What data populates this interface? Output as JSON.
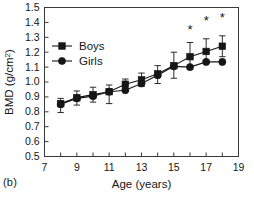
{
  "panel": {
    "label": "(b)"
  },
  "chart_data": {
    "type": "line",
    "title": "",
    "xlabel": "Age (years)",
    "ylabel": "BMD (g/cm²)",
    "xlim": [
      7,
      19
    ],
    "ylim": [
      0.5,
      1.5
    ],
    "xticks": [
      7,
      8,
      9,
      10,
      11,
      12,
      13,
      14,
      15,
      16,
      17,
      18,
      19
    ],
    "xticklabels": [
      "7",
      "",
      "9",
      "",
      "11",
      "",
      "13",
      "",
      "15",
      "",
      "17",
      "",
      "19"
    ],
    "yticks": [
      0.5,
      0.6,
      0.7,
      0.8,
      0.9,
      1.0,
      1.1,
      1.2,
      1.3,
      1.4,
      1.5
    ],
    "yticklabels": [
      "0.5",
      "0.6",
      "0.7",
      "0.8",
      "0.9",
      "1.0",
      "1.1",
      "1.2",
      "1.3",
      "1.4",
      "1.5"
    ],
    "grid": false,
    "legend_position": "upper left",
    "x": [
      8,
      9,
      10,
      11,
      12,
      13,
      14,
      15,
      16,
      17,
      18
    ],
    "series": [
      {
        "name": "Boys",
        "marker": "square",
        "color": "#161616",
        "values": [
          0.855,
          0.895,
          0.915,
          0.935,
          0.985,
          1.015,
          1.055,
          1.11,
          1.17,
          1.205,
          1.24
        ],
        "err_low": [
          0.06,
          0.05,
          0.05,
          0.08,
          0.045,
          0.045,
          0.065,
          0.085,
          0.085,
          0.08,
          0.07
        ],
        "err_high": [
          0.035,
          0.045,
          0.05,
          0.045,
          0.035,
          0.045,
          0.055,
          0.09,
          0.095,
          0.085,
          0.07
        ]
      },
      {
        "name": "Girls",
        "marker": "circle",
        "color": "#161616",
        "values": [
          0.85,
          0.89,
          0.905,
          0.935,
          0.945,
          0.99,
          1.045,
          1.105,
          1.1,
          1.135,
          1.135
        ]
      }
    ],
    "annotations": [
      {
        "text": "*",
        "x": 16,
        "y": 1.325
      },
      {
        "text": "*",
        "x": 17,
        "y": 1.385
      },
      {
        "text": "*",
        "x": 18,
        "y": 1.4
      }
    ]
  }
}
